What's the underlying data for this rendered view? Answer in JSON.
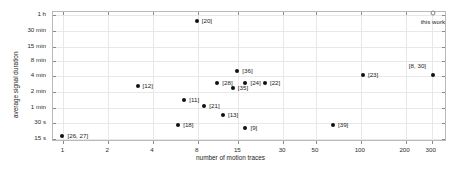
{
  "chart_data": {
    "type": "scatter",
    "title": "",
    "xlabel": "number of motion traces",
    "ylabel": "average signal duration",
    "xscale": "log",
    "yscale": "log",
    "grid": true,
    "legend": "none",
    "xticks": [
      1,
      2,
      4,
      8,
      15,
      30,
      50,
      100,
      200,
      300
    ],
    "xticklabels": [
      "1",
      "2",
      "4",
      "8",
      "15",
      "30",
      "50",
      "100",
      "200",
      "300"
    ],
    "yticks_seconds": [
      3600,
      1800,
      900,
      480,
      240,
      120,
      60,
      30,
      15
    ],
    "yticklabels": [
      "1 h",
      "30 min",
      "15 min",
      "8 min",
      "4 min",
      "2 min",
      "1 min",
      "30 s",
      "15 s"
    ],
    "xlim": [
      0.85,
      380
    ],
    "ylim_seconds": [
      13,
      4200
    ],
    "marker_color": "#111111",
    "highlight_marker_color": "#ffffff",
    "points": [
      {
        "label": "[20]",
        "x": 8,
        "y_seconds": 2700,
        "marker": "filled",
        "label_pos": "right"
      },
      {
        "label": "this work",
        "x": 310,
        "y_seconds": 3900,
        "marker": "open",
        "label_pos": "below"
      },
      {
        "label": "[8, 30]",
        "x": 310,
        "y_seconds": 240,
        "marker": "filled",
        "label_pos": "above-left"
      },
      {
        "label": "[23]",
        "x": 105,
        "y_seconds": 240,
        "marker": "filled",
        "label_pos": "right"
      },
      {
        "label": "[36]",
        "x": 15,
        "y_seconds": 290,
        "marker": "filled",
        "label_pos": "right"
      },
      {
        "label": "[28]",
        "x": 11,
        "y_seconds": 175,
        "marker": "filled",
        "label_pos": "right"
      },
      {
        "label": "[24]",
        "x": 17,
        "y_seconds": 175,
        "marker": "filled",
        "label_pos": "right"
      },
      {
        "label": "[22]",
        "x": 23,
        "y_seconds": 175,
        "marker": "filled",
        "label_pos": "right"
      },
      {
        "label": "[35]",
        "x": 14,
        "y_seconds": 140,
        "marker": "filled",
        "label_pos": "right"
      },
      {
        "label": "[12]",
        "x": 3.2,
        "y_seconds": 150,
        "marker": "filled",
        "label_pos": "right"
      },
      {
        "label": "[11]",
        "x": 6.6,
        "y_seconds": 80,
        "marker": "filled",
        "label_pos": "right"
      },
      {
        "label": "[21]",
        "x": 9,
        "y_seconds": 62,
        "marker": "filled",
        "label_pos": "right"
      },
      {
        "label": "[13]",
        "x": 12,
        "y_seconds": 42,
        "marker": "filled",
        "label_pos": "right"
      },
      {
        "label": "[18]",
        "x": 6,
        "y_seconds": 26,
        "marker": "filled",
        "label_pos": "right"
      },
      {
        "label": "[9]",
        "x": 17,
        "y_seconds": 23,
        "marker": "filled",
        "label_pos": "right"
      },
      {
        "label": "[39]",
        "x": 66,
        "y_seconds": 26,
        "marker": "filled",
        "label_pos": "right"
      },
      {
        "label": "[26, 27]",
        "x": 1,
        "y_seconds": 16,
        "marker": "filled",
        "label_pos": "right"
      }
    ]
  }
}
